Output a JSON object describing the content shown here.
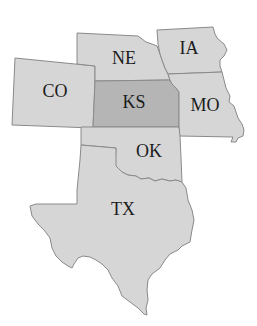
{
  "map": {
    "colors": {
      "default_fill": "#d6d6d6",
      "highlight_fill": "#b5b5b5",
      "border": "#8a8a8a",
      "label": "#1c1c1c",
      "background": "#ffffff"
    },
    "states": [
      {
        "id": "CO",
        "label": "CO",
        "highlighted": false,
        "label_pos": [
          55,
          92
        ]
      },
      {
        "id": "NE",
        "label": "NE",
        "highlighted": false,
        "label_pos": [
          124,
          59
        ]
      },
      {
        "id": "IA",
        "label": "IA",
        "highlighted": false,
        "label_pos": [
          189,
          49
        ]
      },
      {
        "id": "KS",
        "label": "KS",
        "highlighted": true,
        "label_pos": [
          134,
          103
        ]
      },
      {
        "id": "MO",
        "label": "MO",
        "highlighted": false,
        "label_pos": [
          205,
          105
        ]
      },
      {
        "id": "OK",
        "label": "OK",
        "highlighted": false,
        "label_pos": [
          148,
          152
        ]
      },
      {
        "id": "TX",
        "label": "TX",
        "highlighted": false,
        "label_pos": [
          122,
          210
        ]
      }
    ]
  }
}
